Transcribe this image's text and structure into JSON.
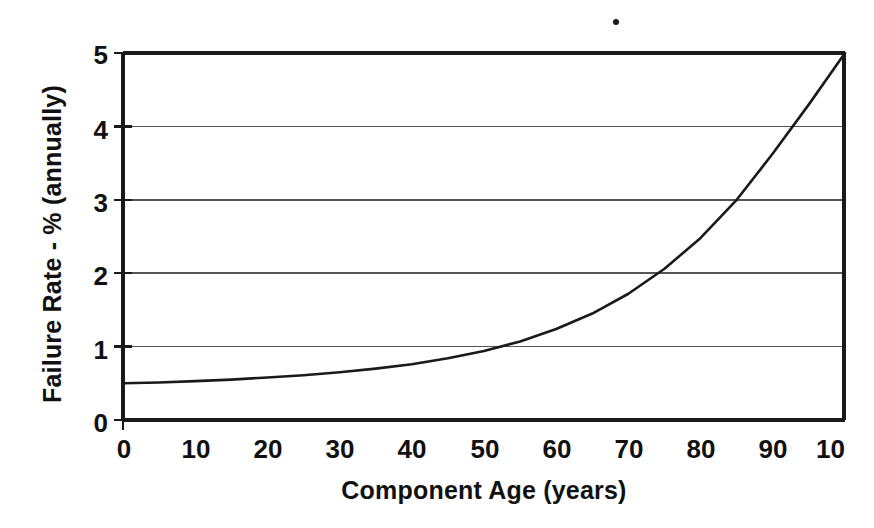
{
  "chart_data": {
    "type": "line",
    "title": "",
    "xlabel": "Component Age (years)",
    "ylabel": "Failure Rate - % (annually)",
    "xlim": [
      0,
      100
    ],
    "ylim": [
      0,
      5
    ],
    "xticks": [
      "0",
      "10",
      "20",
      "30",
      "40",
      "50",
      "60",
      "70",
      "80",
      "90",
      "100"
    ],
    "xtick_values": [
      0,
      10,
      20,
      30,
      40,
      50,
      60,
      70,
      80,
      90,
      100
    ],
    "xtick_last_clipped_label": "10",
    "yticks": [
      "0",
      "1",
      "2",
      "3",
      "4",
      "5"
    ],
    "ytick_values": [
      0,
      1,
      2,
      3,
      4,
      5
    ],
    "grid": "horizontal",
    "gridlines_y": [
      1,
      2,
      3,
      4
    ],
    "legend": "none",
    "series": [
      {
        "name": "Failure Rate",
        "color": "#1a1a1a",
        "x": [
          0,
          5,
          10,
          15,
          20,
          25,
          30,
          35,
          40,
          45,
          50,
          55,
          60,
          65,
          70,
          75,
          80,
          85,
          90,
          95,
          100
        ],
        "values": [
          0.5,
          0.51,
          0.53,
          0.55,
          0.58,
          0.61,
          0.65,
          0.7,
          0.76,
          0.84,
          0.94,
          1.07,
          1.24,
          1.45,
          1.72,
          2.06,
          2.48,
          3.0,
          3.63,
          4.3,
          5.0
        ]
      }
    ],
    "annotations": [
      {
        "name": "scan-speck",
        "x_px": 616,
        "y_px": 22
      }
    ]
  },
  "axes": {
    "frame_color": "#1a1a1a",
    "grid_color": "#555555",
    "curve_color": "#1a1a1a",
    "background": "#ffffff"
  }
}
